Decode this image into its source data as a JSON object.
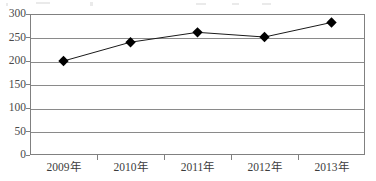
{
  "chart_data": {
    "type": "line",
    "title": "",
    "subtitle": "",
    "xlabel": "",
    "ylabel": "",
    "categories": [
      "2009年",
      "2010年",
      "2011年",
      "2012年",
      "2013年"
    ],
    "values": [
      200,
      240,
      261,
      251,
      282
    ],
    "series": [
      {
        "name": "",
        "values": [
          200,
          240,
          261,
          251,
          282
        ]
      }
    ],
    "ylim": [
      0,
      300
    ],
    "y_ticks": [
      0,
      50,
      100,
      150,
      200,
      250,
      300
    ],
    "y_tick_labels": [
      "0",
      "50",
      "100",
      "150",
      "200",
      "250",
      "300"
    ],
    "grid": true,
    "grid_axis": "y",
    "legend": false,
    "legend_position": "none",
    "marker": "diamond",
    "marker_color": "#000000",
    "line_color": "#1a1a1a",
    "grid_color": "#8a8a8a",
    "axis_color": "#808080",
    "label_color": "#4a4a4a",
    "background_color": "#ffffff"
  }
}
